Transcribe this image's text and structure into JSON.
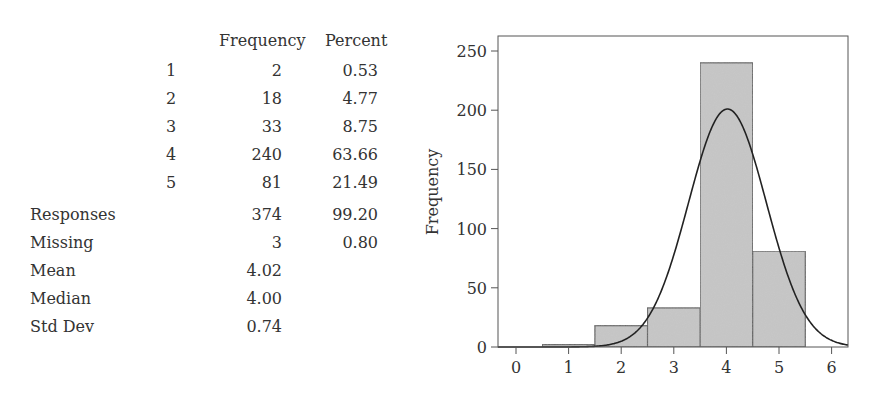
{
  "table": {
    "headers": {
      "frequency": "Frequency",
      "percent": "Percent"
    },
    "rows": [
      {
        "level": "1",
        "frequency": "2",
        "percent": "0.53"
      },
      {
        "level": "2",
        "frequency": "18",
        "percent": "4.77"
      },
      {
        "level": "3",
        "frequency": "33",
        "percent": "8.75"
      },
      {
        "level": "4",
        "frequency": "240",
        "percent": "63.66"
      },
      {
        "level": "5",
        "frequency": "81",
        "percent": "21.49"
      }
    ],
    "summary": [
      {
        "label": "Responses",
        "frequency": "374",
        "percent": "99.20"
      },
      {
        "label": "Missing",
        "frequency": "3",
        "percent": "0.80"
      },
      {
        "label": "Mean",
        "frequency": "4.02",
        "percent": ""
      },
      {
        "label": "Median",
        "frequency": "4.00",
        "percent": ""
      },
      {
        "label": "Std Dev",
        "frequency": "0.74",
        "percent": ""
      }
    ]
  },
  "chart_data": {
    "type": "bar",
    "subtype": "histogram with normal curve overlay",
    "title": "",
    "xlabel": "",
    "ylabel": "Frequency",
    "categories": [
      "1",
      "2",
      "3",
      "4",
      "5"
    ],
    "values": [
      2,
      18,
      33,
      240,
      81
    ],
    "bin_edges": [
      0.5,
      1.5,
      2.5,
      3.5,
      4.5,
      5.5
    ],
    "x_ticks": [
      "0",
      "1",
      "2",
      "3",
      "4",
      "5",
      "6"
    ],
    "y_ticks": [
      "0",
      "50",
      "100",
      "150",
      "200",
      "250"
    ],
    "xlim": [
      -0.35,
      6.3
    ],
    "ylim": [
      0,
      262
    ],
    "overlay": {
      "type": "normal-curve",
      "mean": 4.02,
      "std_dev": 0.74,
      "peak": 201
    },
    "bar_color": "#c8c8c8",
    "bar_edge_color": "#555555",
    "curve_color": "#222222",
    "grid": false,
    "legend": "none"
  }
}
